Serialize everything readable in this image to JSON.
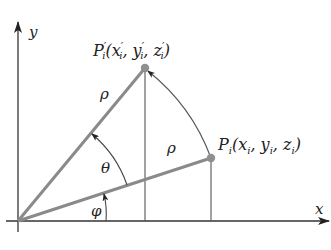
{
  "diagram": {
    "type": "geometry-rotation",
    "axes": {
      "x_label": "x",
      "y_label": "y"
    },
    "points": {
      "original": {
        "name": "P",
        "subscript": "i",
        "coords_label": "(x",
        "x_sub": "i",
        "sep1": ", y",
        "y_sub": "i",
        "sep2": ", z",
        "z_sub": "i",
        "close": ")"
      },
      "rotated": {
        "name": "P",
        "prime": "′",
        "subscript": "i",
        "coords_label": "(x",
        "x_prime": "′",
        "x_sub": "i",
        "sep1": ", y",
        "y_prime": "′",
        "y_sub": "i",
        "sep2": ", z",
        "z_prime": "′",
        "z_sub": "i",
        "close": ")"
      }
    },
    "labels": {
      "radius_rotated": "ρ",
      "radius_original": "ρ",
      "rotation_angle": "θ",
      "initial_angle": "φ"
    },
    "colors": {
      "axis": "#333333",
      "radius_line": "#8a8a8a",
      "point": "#8f8f8f",
      "arc": "#555555",
      "text": "#222222"
    }
  }
}
